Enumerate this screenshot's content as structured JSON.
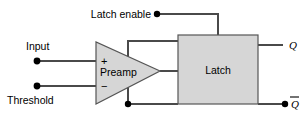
{
  "figure": {
    "kind": "block-diagram",
    "background_color": "#ffffff",
    "wire_color": "#404040",
    "block_fill": "#d4d4d4",
    "block_stroke": "#555555",
    "text_color": "#000000"
  },
  "labels": {
    "latch_enable": "Latch enable",
    "input": "Input",
    "threshold": "Threshold",
    "preamp": "Preamp",
    "latch": "Latch",
    "plus_sign": "+",
    "minus_sign": "−",
    "q_out": "Q",
    "q_bar_out": "Q"
  },
  "terminals": [
    {
      "name": "input-terminal",
      "label": "Input",
      "x": 37,
      "y": 61
    },
    {
      "name": "threshold-terminal",
      "label": "Threshold",
      "x": 37,
      "y": 86
    },
    {
      "name": "latch-enable-terminal",
      "label": "Latch enable",
      "x": 157,
      "y": 14
    },
    {
      "name": "q-bar-terminal",
      "label": "Q-bar",
      "x": 285,
      "y": 104
    }
  ],
  "junctions": [
    {
      "name": "preamp-bottom-feedback-junction",
      "x": 128,
      "y": 104
    }
  ],
  "blocks": [
    {
      "name": "preamp",
      "shape": "triangle",
      "label": "Preamp",
      "x": 95,
      "y": 42,
      "width": 65,
      "height": 62
    },
    {
      "name": "latch",
      "shape": "rectangle",
      "label": "Latch",
      "x": 178,
      "y": 35,
      "width": 80,
      "height": 69
    }
  ],
  "nets": [
    {
      "name": "input-to-preamp-plus",
      "from": "input-terminal",
      "to": "preamp +"
    },
    {
      "name": "threshold-to-preamp-minus",
      "from": "threshold-terminal",
      "to": "preamp −"
    },
    {
      "name": "latch-enable-to-latch-top",
      "from": "latch-enable-terminal",
      "to": "latch top"
    },
    {
      "name": "preamp-top-feedback-to-latch",
      "from": "preamp top",
      "to": "latch left upper"
    },
    {
      "name": "preamp-output-to-latch",
      "from": "preamp tip",
      "to": "latch left middle"
    },
    {
      "name": "preamp-bottom-feedback-to-latch",
      "from": "preamp bottom junction",
      "to": "latch left lower"
    },
    {
      "name": "latch-to-q",
      "from": "latch right upper",
      "to": "Q"
    },
    {
      "name": "latch-to-q-bar",
      "from": "latch right lower",
      "to": "Q-bar"
    }
  ]
}
